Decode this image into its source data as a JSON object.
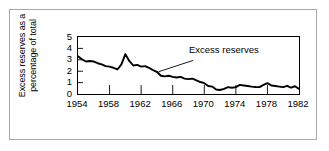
{
  "chart_data": {
    "type": "line",
    "title": "",
    "xlabel": "",
    "ylabel": "Excess reserves as a percentage of total",
    "ylabel_lines": [
      "Excess reserves as a",
      "percentage of total"
    ],
    "xlim": [
      1954,
      1982
    ],
    "ylim": [
      0,
      5
    ],
    "grid": false,
    "legend": "none",
    "ytick_labels": [
      "5",
      "4",
      "3",
      "2",
      "1",
      "0"
    ],
    "ytick_values": [
      5,
      4,
      3,
      2,
      1,
      0
    ],
    "xtick_labels": [
      "1954",
      "1958",
      "1962",
      "1966",
      "1970",
      "1974",
      "1978",
      "1982"
    ],
    "xtick_values": [
      1954,
      1958,
      1962,
      1966,
      1970,
      1974,
      1978,
      1982
    ],
    "annotations": [
      {
        "text": "Excess reserves",
        "points_to_x": 1964.2,
        "points_to_y": 1.95
      }
    ],
    "series": [
      {
        "name": "Excess reserves",
        "color": "#000000",
        "x": [
          1954.0,
          1954.5,
          1955.0,
          1955.5,
          1956.0,
          1956.5,
          1957.0,
          1957.5,
          1958.0,
          1958.5,
          1959.0,
          1959.5,
          1960.0,
          1960.5,
          1961.0,
          1961.5,
          1962.0,
          1962.5,
          1963.0,
          1963.5,
          1964.0,
          1964.5,
          1965.0,
          1965.5,
          1966.0,
          1966.5,
          1967.0,
          1967.5,
          1968.0,
          1968.5,
          1969.0,
          1969.5,
          1970.0,
          1970.5,
          1971.0,
          1971.5,
          1972.0,
          1972.5,
          1973.0,
          1973.5,
          1974.0,
          1974.5,
          1975.0,
          1975.5,
          1976.0,
          1976.5,
          1977.0,
          1977.5,
          1978.0,
          1978.5,
          1979.0,
          1979.5,
          1980.0,
          1980.5,
          1981.0,
          1981.5,
          1982.0
        ],
        "y": [
          3.3,
          3.05,
          2.85,
          2.9,
          2.85,
          2.7,
          2.6,
          2.45,
          2.4,
          2.3,
          2.15,
          2.6,
          3.5,
          2.9,
          2.5,
          2.55,
          2.4,
          2.45,
          2.3,
          2.1,
          1.95,
          1.6,
          1.55,
          1.6,
          1.5,
          1.45,
          1.5,
          1.35,
          1.3,
          1.35,
          1.2,
          1.05,
          0.95,
          0.7,
          0.65,
          0.4,
          0.35,
          0.45,
          0.6,
          0.55,
          0.6,
          0.8,
          0.75,
          0.7,
          0.65,
          0.62,
          0.6,
          0.8,
          0.95,
          0.75,
          0.7,
          0.65,
          0.6,
          0.72,
          0.55,
          0.68,
          0.45
        ]
      }
    ]
  }
}
